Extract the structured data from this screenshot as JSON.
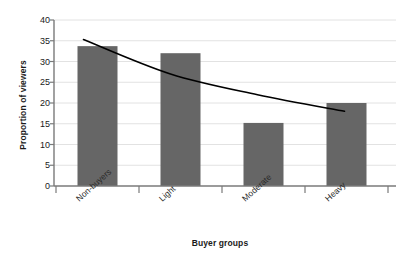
{
  "chart_data": {
    "type": "bar",
    "title": "",
    "xlabel": "Buyer groups",
    "ylabel": "Proportion of viewers",
    "categories": [
      "Non-buyers",
      "Light",
      "Moderate",
      "Heavy"
    ],
    "values": [
      33.7,
      32.0,
      15.2,
      20.0
    ],
    "ylim": [
      0,
      40
    ],
    "yticks": [
      0,
      5,
      10,
      15,
      20,
      25,
      30,
      35,
      40
    ],
    "ytick_labels": [
      "0",
      "5",
      "10",
      "15",
      "20",
      "25",
      "30",
      "35",
      "40"
    ],
    "grid": true,
    "legend": "none",
    "bar_color": "#666666",
    "series": [
      {
        "name": "Proportion of viewers",
        "type": "bar",
        "values": [
          33.7,
          32.0,
          15.2,
          20.0
        ]
      },
      {
        "name": "trend",
        "type": "line",
        "color": "#000000",
        "x": [
          "Non-buyers",
          "Light",
          "Moderate",
          "Heavy"
        ],
        "values": [
          35.3,
          27.0,
          22.0,
          18.0
        ]
      }
    ]
  }
}
